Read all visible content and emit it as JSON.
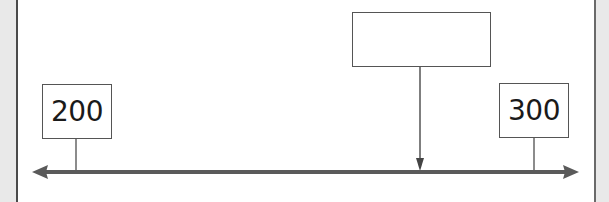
{
  "number_line": {
    "start_label": "200",
    "end_label": "300",
    "unknown_label": "",
    "line_color": "#555555",
    "text_color": "#1a1a1a"
  }
}
